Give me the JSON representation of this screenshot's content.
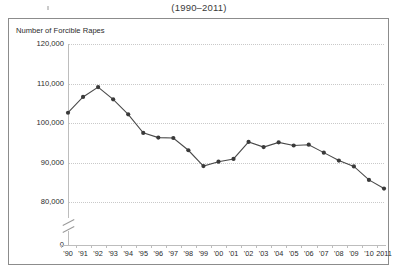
{
  "chart_title": "(1990–2011)",
  "axis": {
    "y_title": "Number of Forcible Rapes",
    "y_ticks": [
      "120,000",
      "110,000",
      "100,000",
      "90,000",
      "80,000",
      "0"
    ],
    "x_ticks": [
      "'90",
      "'91",
      "'92",
      "'93",
      "'94",
      "'95",
      "'96",
      "'97",
      "'98",
      "'99",
      "'00",
      "'01",
      "'02",
      "'03",
      "'04",
      "'05",
      "'06",
      "'07",
      "'08",
      "'09",
      "'10",
      "2011"
    ],
    "y_break": true
  },
  "style": {
    "line_color": "#4a4a4a",
    "marker_color": "#3a3a3a",
    "grid_color": "#c9c9c9",
    "frame_color": "#8c8c8c",
    "text_color": "#2b2b2b"
  },
  "chart_data": {
    "type": "line",
    "title": "(1990–2011)",
    "xlabel": "",
    "ylabel": "Number of Forcible Rapes",
    "ylim": [
      80000,
      120000
    ],
    "y_break_below": 80000,
    "grid": true,
    "legend": "none",
    "categories": [
      "'90",
      "'91",
      "'92",
      "'93",
      "'94",
      "'95",
      "'96",
      "'97",
      "'98",
      "'99",
      "'00",
      "'01",
      "'02",
      "'03",
      "'04",
      "'05",
      "'06",
      "'07",
      "'08",
      "'09",
      "'10",
      "2011"
    ],
    "x_full_years": [
      1990,
      1991,
      1992,
      1993,
      1994,
      1995,
      1996,
      1997,
      1998,
      1999,
      2000,
      2001,
      2002,
      2003,
      2004,
      2005,
      2006,
      2007,
      2008,
      2009,
      2010,
      2011
    ],
    "values": [
      102600,
      106600,
      109100,
      106000,
      102200,
      97500,
      96300,
      96200,
      93100,
      89100,
      90200,
      90900,
      95200,
      93900,
      95100,
      94300,
      94500,
      92500,
      90500,
      89000,
      85600,
      83400
    ],
    "series": [
      {
        "name": "Forcible rapes",
        "values": [
          102600,
          106600,
          109100,
          106000,
          102200,
          97500,
          96300,
          96200,
          93100,
          89100,
          90200,
          90900,
          95200,
          93900,
          95100,
          94300,
          94500,
          92500,
          90500,
          89000,
          85600,
          83400
        ]
      }
    ]
  }
}
